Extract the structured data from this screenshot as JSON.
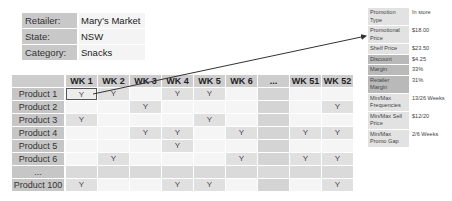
{
  "info": [
    {
      "label": "Retailer:",
      "value": "Mary’s Market"
    },
    {
      "label": "State:",
      "value": "NSW"
    },
    {
      "label": "Category:",
      "value": "Snacks"
    }
  ],
  "grid": {
    "columns": [
      "WK 1",
      "WK 2",
      "WK 3",
      "WK 4",
      "WK 5",
      "WK 6",
      "...",
      "WK 51",
      "WK 52"
    ],
    "rows": [
      {
        "label": "Product 1",
        "cells": [
          "Y",
          "Y",
          "",
          "Y",
          "Y",
          "",
          "",
          "",
          ""
        ]
      },
      {
        "label": "Product 2",
        "cells": [
          "",
          "",
          "Y",
          "",
          "",
          "",
          "",
          "",
          "Y"
        ]
      },
      {
        "label": "Product 3",
        "cells": [
          "Y",
          "",
          "",
          "",
          "Y",
          "",
          "",
          "",
          ""
        ]
      },
      {
        "label": "Product 4",
        "cells": [
          "",
          "",
          "Y",
          "Y",
          "",
          "Y",
          "",
          "Y",
          "Y"
        ]
      },
      {
        "label": "Product 5",
        "cells": [
          "",
          "",
          "",
          "Y",
          "",
          "",
          "",
          "",
          ""
        ]
      },
      {
        "label": "Product 6",
        "cells": [
          "",
          "Y",
          "",
          "",
          "",
          "Y",
          "",
          "Y",
          "Y"
        ]
      },
      {
        "label": "...",
        "cells": [
          "",
          "",
          "",
          "",
          "",
          "",
          "",
          "",
          ""
        ]
      },
      {
        "label": "Product 100",
        "cells": [
          "Y",
          "",
          "",
          "Y",
          "Y",
          "",
          "",
          "",
          "Y"
        ]
      }
    ],
    "selected_cell": {
      "row": 0,
      "col": 0
    }
  },
  "panel": [
    {
      "label": "Promotion Type",
      "value": "In store",
      "shade": "light"
    },
    {
      "label": "Promotional Price",
      "value": "$18.00",
      "shade": "light"
    },
    {
      "label": "Shelf Price",
      "value": "$23.50",
      "shade": "light"
    },
    {
      "label": "Discount",
      "value": "$4.25",
      "shade": "dark"
    },
    {
      "label": "Margin",
      "value": "33%",
      "shade": "dark"
    },
    {
      "label": "Retailer Margin",
      "value": "31%",
      "shade": "dark"
    },
    {
      "label": "Min/Max Frequencies",
      "value": "13/26 Weeks",
      "shade": "light"
    },
    {
      "label": "Min/Max Sell Price",
      "value": "$12/20",
      "shade": "light"
    },
    {
      "label": "Min/Max Promo Gap",
      "value": "2/6 Weeks",
      "shade": "light"
    }
  ],
  "colors": {
    "label_bg": "#c8c8c8",
    "dark_label_bg": "#b9b9b9",
    "arrow": "#333333"
  }
}
